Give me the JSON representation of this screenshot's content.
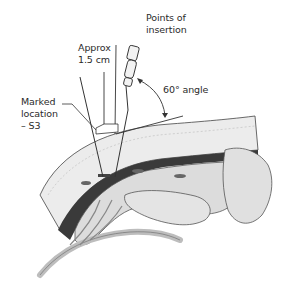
{
  "diagram": {
    "type": "medical-illustration",
    "labels": {
      "points_of_insertion_line1": "Points of",
      "points_of_insertion_line2": "insertion",
      "approx_line1": "Approx",
      "approx_line2": "1.5 cm",
      "marked_line1": "Marked",
      "marked_line2": "location",
      "marked_line3": "– S3",
      "angle": "60° angle"
    },
    "colors": {
      "background": "#ffffff",
      "line": "#333333",
      "bone": "#d9d9d9",
      "bone_shadow": "#a8a8a8",
      "skin_layer": "#e6e6e6",
      "muscle_band": "#3a3a3a",
      "nerve": "#cfcfcf"
    }
  }
}
